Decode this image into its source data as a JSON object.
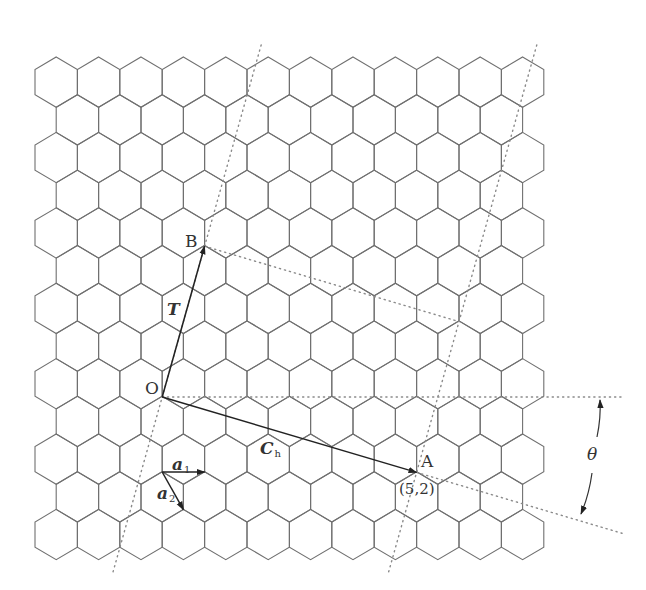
{
  "diagram": {
    "lattice": {
      "rows": 13,
      "even_row_count": 12,
      "odd_row_count": 11,
      "origin_x": 35,
      "origin_top_y": 57,
      "hex_width": 42.4,
      "row_pitch": 37.7,
      "stroke_color": "#707070"
    },
    "points": {
      "O": {
        "x": 162.2,
        "y": 397
      },
      "A": {
        "x": 416.6,
        "y": 472.4
      },
      "B": {
        "x": 204.6,
        "y": 246.2
      },
      "a_origin": {
        "x": 162.2,
        "y": 472
      }
    },
    "chiral_index": {
      "n": 5,
      "m": 2
    },
    "translation_index": {
      "t1": 3,
      "t2": -4
    },
    "labels": {
      "O": "O",
      "A": "A",
      "B": "B",
      "T": "T",
      "Ch_main": "C",
      "Ch_sub": "h",
      "a1_main": "a",
      "a1_sub": "1",
      "a2_main": "a",
      "a2_sub": "2",
      "chiral_pair": "(5,2)",
      "theta": "θ"
    },
    "colors": {
      "vector": "#222222",
      "dotted": "#8a8a8a",
      "label": "#333333"
    }
  }
}
